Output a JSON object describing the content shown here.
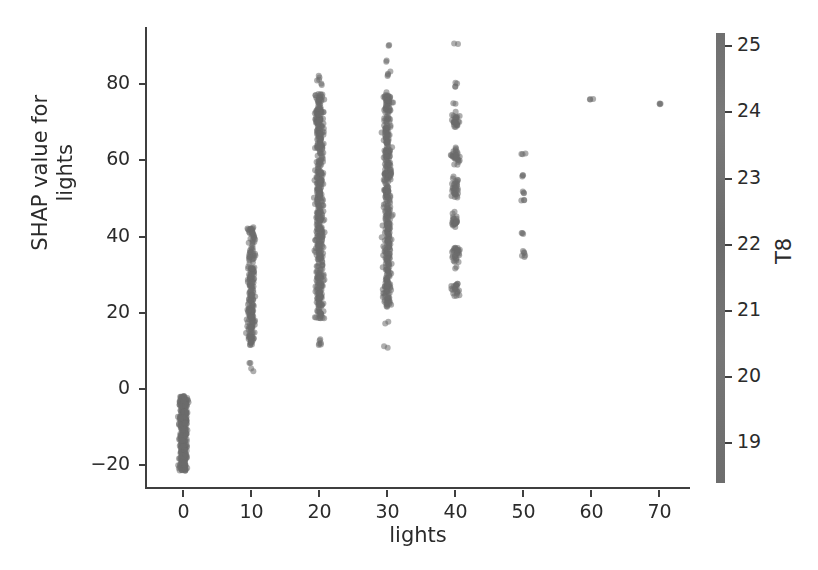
{
  "figure": {
    "background": "#ffffff",
    "point_color": "#6b6b6b",
    "axis_color": "#3f3f3f",
    "text_color": "#2b2b2b"
  },
  "chart_data": {
    "type": "scatter",
    "title": "",
    "xlabel": "lights",
    "ylabel": "SHAP value for\nlights",
    "xlim": [
      -5.5,
      74.5
    ],
    "ylim": [
      -26,
      95
    ],
    "grid": false,
    "xticks": [
      0,
      10,
      20,
      30,
      40,
      50,
      60,
      70
    ],
    "xticklabels": [
      "0",
      "10",
      "20",
      "30",
      "40",
      "50",
      "60",
      "70"
    ],
    "yticks": [
      -20,
      0,
      20,
      40,
      60,
      80
    ],
    "yticklabels": [
      "−20",
      "0",
      "20",
      "40",
      "60",
      "80"
    ],
    "colorbar": {
      "label": "T8",
      "ticks": [
        19,
        20,
        21,
        22,
        23,
        24,
        25
      ],
      "ticklabels": [
        "19",
        "20",
        "21",
        "22",
        "23",
        "24",
        "25"
      ],
      "vmin": 18.4,
      "vmax": 25.2,
      "orientation": "vertical",
      "position": "right",
      "cmap": "grayscale"
    },
    "marker": {
      "size": 6,
      "alpha": 0.55,
      "jitter_x": 1.1
    },
    "clusters": [
      {
        "x": 0,
        "n": 420,
        "y_min": -21.5,
        "y_max": -1.8,
        "density": "very-dense-continuous",
        "outliers": []
      },
      {
        "x": 10,
        "n": 230,
        "y_min": 11.5,
        "y_max": 43.0,
        "density": "dense-continuous",
        "outliers": [
          7.0,
          5.0
        ]
      },
      {
        "x": 20,
        "n": 520,
        "y_min": 18.5,
        "y_max": 77.5,
        "density": "very-dense-continuous",
        "outliers": [
          82.0,
          81.0,
          80.0,
          13.0,
          12.0,
          11.5
        ]
      },
      {
        "x": 30,
        "n": 430,
        "y_min": 21.5,
        "y_max": 78.0,
        "density": "very-dense-continuous",
        "outliers": [
          90.0,
          86.0,
          83.0,
          82.5,
          17.5,
          11.0
        ]
      },
      {
        "x": 40,
        "n": 170,
        "y_min": 26.5,
        "y_max": 70.0,
        "density": "sparse-banded",
        "outliers": [
          90.5,
          80.5,
          79.5,
          75.0,
          71.5,
          70.0
        ]
      },
      {
        "x": 50,
        "n": 7,
        "y_min": 35.0,
        "y_max": 62.0,
        "density": "discrete",
        "outliers": [
          62.0,
          56.0,
          51.5,
          49.5,
          41.0,
          36.0,
          35.0
        ]
      },
      {
        "x": 60,
        "n": 1,
        "y_min": 76.0,
        "y_max": 76.0,
        "density": "discrete",
        "outliers": [
          76.0
        ]
      },
      {
        "x": 70,
        "n": 1,
        "y_min": 75.0,
        "y_max": 75.0,
        "density": "discrete",
        "outliers": [
          75.0
        ]
      }
    ]
  }
}
